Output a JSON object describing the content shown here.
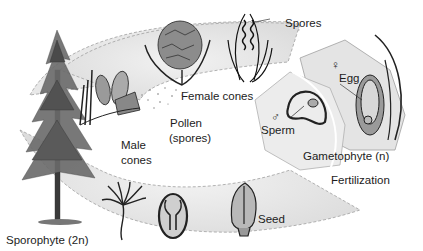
{
  "diagram": {
    "colors": {
      "band_fill": "#e6e6e6",
      "band_edge": "#9a9a9a",
      "ink": "#1c1c1c",
      "tree": "#4a4a4a",
      "background": "#ffffff"
    },
    "labels": {
      "spores": "Spores",
      "female_cones": "Female cones",
      "pollen_line1": "Pollen",
      "pollen_line2": "(spores)",
      "male_cones_line1": "Male",
      "male_cones_line2": "cones",
      "egg": "Egg",
      "sperm": "Sperm",
      "gametophyte": "Gametophyte (n)",
      "fertilization": "Fertilization",
      "seed": "Seed",
      "sporophyte": "Sporophyte (2n)"
    },
    "symbols": {
      "female": "♀",
      "male": "♂"
    },
    "stages": [
      {
        "name": "sporophyte-tree",
        "label": "Sporophyte (2n)"
      },
      {
        "name": "male-cones",
        "label": "Male cones"
      },
      {
        "name": "pollen",
        "label": "Pollen (spores)"
      },
      {
        "name": "female-cones",
        "label": "Female cones"
      },
      {
        "name": "spores",
        "label": "Spores"
      },
      {
        "name": "gametophyte",
        "label": "Gametophyte (n)"
      },
      {
        "name": "fertilization",
        "label": "Fertilization"
      },
      {
        "name": "seed",
        "label": "Seed"
      },
      {
        "name": "seedling",
        "label": ""
      }
    ]
  }
}
